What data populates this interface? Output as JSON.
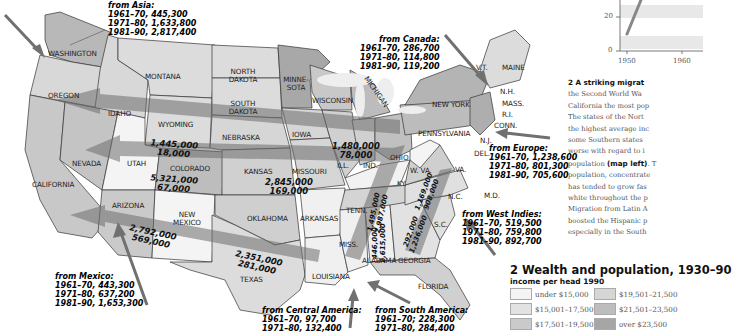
{
  "states": {
    "washington": "WASHINGTON",
    "oregon": "OREGON",
    "california": "CALIFORNIA",
    "idaho": "IDAHO",
    "montana": "MONTANA",
    "wyoming": "WYOMING",
    "nevada": "NEVADA",
    "utah": "UTAH",
    "colorado": "COLORADO",
    "arizona": "ARIZONA",
    "new_mexico": "NEW MEXICO",
    "north_dakota": "NORTH DAKOTA",
    "south_dakota": "SOUTH DAKOTA",
    "nebraska": "NEBRASKA",
    "kansas": "KANSAS",
    "oklahoma": "OKLAHOMA",
    "texas": "TEXAS",
    "minnesota": "MINNE-SOTA",
    "iowa": "IOWA",
    "missouri": "MISSOURI",
    "arkansas": "ARKANSAS",
    "louisiana": "LOUISIANA",
    "wisconsin": "WISCONSIN",
    "michigan": "MICHIGAN",
    "illinois": "ILL.",
    "indiana": "IND.",
    "ohio": "OHIO",
    "kentucky": "KY.",
    "tennessee": "TENN.",
    "mississippi": "MISS.",
    "alabama": "ALABAMA",
    "georgia": "GEORGIA",
    "florida": "FLORIDA",
    "south_carolina": "S.C.",
    "north_carolina": "N.C.",
    "virginia": "VA.",
    "west_virginia": "W. VA.",
    "pennsylvania": "PENNSYLVANIA",
    "new_york": "NEW YORK",
    "vermont": "V.T.",
    "maine": "MAINE",
    "new_hampshire": "N.H.",
    "massachusetts": "MASS.",
    "rhode_island": "R.I.",
    "connecticut": "CONN.",
    "new_jersey": "N.J.",
    "delaware": "DEL.",
    "maryland": "M.D."
  },
  "immigration": {
    "asia": {
      "title": "from Asia:",
      "lines": [
        "1961–70, 445,300",
        "1971–80, 1,633,800",
        "1981–90, 2,817,400"
      ]
    },
    "canada": {
      "title": "from Canada:",
      "lines": [
        "1961–70, 286,700",
        "1971–80, 114,800",
        "1981–90, 119,200"
      ]
    },
    "europe": {
      "title": "from Europe:",
      "lines": [
        "1961–70, 1,238,600",
        "1971–80, 801,300",
        "1981–90, 705,600"
      ]
    },
    "west_indies": {
      "title": "from West Indies:",
      "lines": [
        "1961–70, 519,500",
        "1971–80, 759,800",
        "1981–90, 892,700"
      ]
    },
    "mexico": {
      "title": "from Mexico:",
      "lines": [
        "1961–70, 443,300",
        "1971–80, 637,200",
        "1981–90, 1,653,300"
      ]
    },
    "central_america": {
      "title": "from Central America:",
      "lines": [
        "1961–70, 97,700",
        "1971–80, 132,400"
      ]
    },
    "south_america": {
      "title": "from South America:",
      "lines": [
        "1961–70; 228,300",
        "1971–80, 284,400"
      ]
    }
  },
  "flows": {
    "north": {
      "a": "1,445,000",
      "b": "18,000"
    },
    "central": {
      "a": "5,321,000",
      "b": "67,000"
    },
    "southwest": {
      "a": "2,792,000",
      "b": "569,000"
    },
    "great_lakes": {
      "a": "1,480,000",
      "b": "78,000"
    },
    "kansas": {
      "a": "2,845,000",
      "b": "169,000"
    },
    "texas": {
      "a": "2,351,000",
      "b": "281,000"
    },
    "tenn": {
      "a": "1,495,000",
      "b": "2,987,000"
    },
    "alabama": {
      "a": "446,000",
      "b": "2,615,000"
    },
    "virginia": {
      "a": "1,169,000",
      "b": "908,000"
    },
    "georgia": {
      "a": "292,000",
      "b": "1,236,000"
    }
  },
  "chart": {
    "y_ticks": [
      "20",
      "0"
    ],
    "x_ticks": [
      "1950",
      "1960"
    ]
  },
  "caption": {
    "heading": "2 A striking migrat",
    "lines": [
      "the Second World Wa",
      "California the most pop",
      "The states of the Nort",
      "the highest average inc",
      "some Southern states",
      "worse with regard to i"
    ],
    "line7_pre": "population ",
    "line7_bold": "(map left)",
    "line7_post": ". T",
    "lines2": [
      "population, concentrate",
      "has tended to grow fas",
      "white throughout the p",
      "Migration from Latin A",
      "boosted the Hispanic p",
      "especially in the South"
    ]
  },
  "legend": {
    "title": "2 Wealth and population, 1930–90",
    "subtitle": "income per head 1990",
    "items": [
      {
        "label": "under $15,000",
        "color": "#f4f4f4"
      },
      {
        "label": "$19,501–21,500",
        "color": "#d6d6d6"
      },
      {
        "label": "$15,001–17,500",
        "color": "#e2e2e2"
      },
      {
        "label": "$21,501–23,500",
        "color": "#bdbdbd"
      },
      {
        "label": "$17,501–19,500",
        "color": "#cacaca"
      },
      {
        "label": "over $23,500",
        "color": "#a6a6a6"
      }
    ]
  }
}
